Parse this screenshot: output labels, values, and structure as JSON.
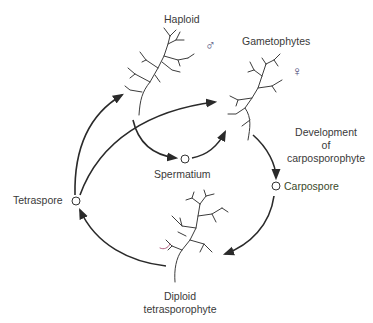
{
  "diagram": {
    "labels": {
      "haploid": "Haploid",
      "gametophytes": "Gametophytes",
      "male_symbol": "♂",
      "female_symbol": "♀",
      "spermatium": "Spermatium",
      "development_1": "Development",
      "development_2": "of",
      "development_3": "carposporophyte",
      "carpospore": "Carpospore",
      "tetraspore": "Tetraspore",
      "diploid_1": "Diploid",
      "diploid_2": "tetrasporophyte"
    },
    "nodes": [
      "Haploid male gametophyte",
      "Female gametophyte",
      "Spermatium",
      "Carpospore",
      "Diploid tetrasporophyte",
      "Tetraspore"
    ],
    "colors": {
      "line": "#2a2a2a",
      "plant": "#3c3c3c",
      "carpospore_text": "#3a4a2a",
      "symbol": "#4a4a78"
    }
  }
}
